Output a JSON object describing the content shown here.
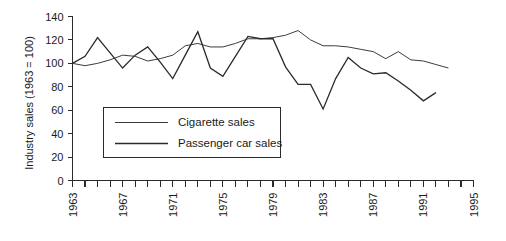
{
  "chart_data": {
    "type": "line",
    "title": "",
    "xlabel": "",
    "ylabel": "Industry sales (1963 = 100)",
    "ylim": [
      0,
      140
    ],
    "xlim": [
      1963,
      1995
    ],
    "grid": false,
    "legend_position": "inside-lower-left",
    "y_ticks": [
      0,
      20,
      40,
      60,
      80,
      100,
      120,
      140
    ],
    "x_ticks": [
      1963,
      1964,
      1965,
      1966,
      1967,
      1968,
      1969,
      1970,
      1971,
      1972,
      1973,
      1974,
      1975,
      1976,
      1977,
      1978,
      1979,
      1980,
      1981,
      1982,
      1983,
      1984,
      1985,
      1986,
      1987,
      1988,
      1989,
      1990,
      1991,
      1992,
      1993,
      1994,
      1995
    ],
    "x_tick_labels": [
      "1963",
      "",
      "",
      "",
      "1967",
      "",
      "",
      "",
      "1971",
      "",
      "",
      "",
      "1975",
      "",
      "",
      "",
      "1979",
      "",
      "",
      "",
      "1983",
      "",
      "",
      "",
      "1987",
      "",
      "",
      "",
      "1991",
      "",
      "",
      "",
      "1995"
    ],
    "x": [
      1963,
      1964,
      1965,
      1966,
      1967,
      1968,
      1969,
      1970,
      1971,
      1972,
      1973,
      1974,
      1975,
      1976,
      1977,
      1978,
      1979,
      1980,
      1981,
      1982,
      1983,
      1984,
      1985,
      1986,
      1987,
      1988,
      1989,
      1990,
      1991,
      1992,
      1993
    ],
    "series": [
      {
        "name": "Cigarette sales",
        "color": "#3c3c3c",
        "width": 1.0,
        "values": [
          100,
          98,
          100,
          103,
          107,
          106,
          102,
          104,
          107,
          115,
          117,
          114,
          114,
          117,
          121,
          121,
          122,
          124,
          128,
          120,
          115,
          115,
          114,
          112,
          110,
          104,
          110,
          103,
          102,
          99,
          96
        ]
      },
      {
        "name": "Passenger car sales",
        "color": "#2b2b2b",
        "width": 1.3,
        "values": [
          100,
          106,
          122,
          109,
          96,
          107,
          114,
          101,
          87,
          107,
          127,
          96,
          89,
          106,
          123,
          121,
          121,
          97,
          82,
          82,
          61,
          87,
          105,
          96,
          91,
          92,
          85,
          77,
          68,
          75,
          null
        ]
      }
    ]
  },
  "legend": {
    "entries": [
      {
        "label": "Cigarette sales"
      },
      {
        "label": "Passenger car sales"
      }
    ]
  },
  "axis": {
    "y_title": "Industry sales (1963 = 100)"
  },
  "colors": {
    "background": "#ffffff",
    "axis": "#2b2b2b",
    "text": "#1a1a1a",
    "cigarette": "#3c3c3c",
    "car": "#2b2b2b"
  }
}
